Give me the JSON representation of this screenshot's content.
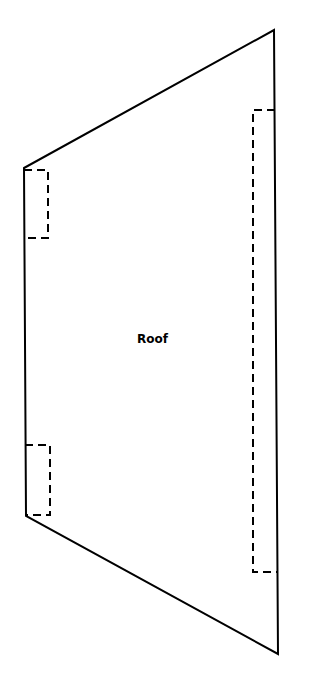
{
  "diagram": {
    "shape_label": "Roof",
    "outline_color": "#000000",
    "background": "#ffffff"
  }
}
